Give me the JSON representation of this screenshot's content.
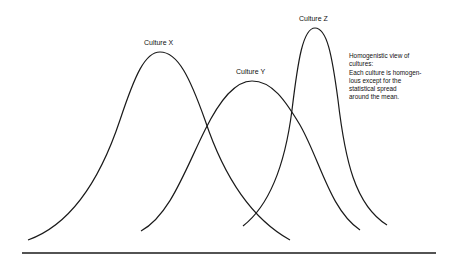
{
  "diagram": {
    "curves": [
      {
        "id": "x",
        "label": "Culture X",
        "peak": [
          160,
          52
        ]
      },
      {
        "id": "y",
        "label": "Culture Y",
        "peak": [
          250,
          81
        ]
      },
      {
        "id": "z",
        "label": "Culture Z",
        "peak": [
          314,
          28
        ]
      }
    ],
    "note": {
      "lines": [
        "Homogenistic view of",
        "cultures:",
        "Each culture is homogen-",
        "lous except for the",
        "statistical spread",
        "around the mean."
      ]
    }
  }
}
